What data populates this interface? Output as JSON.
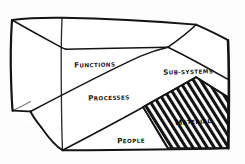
{
  "diagram": {
    "style": "hand-drawn-pen-sketch",
    "background_color": "#fdfdfd",
    "ink_color": "#161616",
    "shape": "3d-box",
    "faces": [
      {
        "id": "functions",
        "label": "FUNCTIONS",
        "label_first_letter": "F",
        "label_rest": "UNCTIONS",
        "hatched": false
      },
      {
        "id": "sub-systems",
        "label": "SUB-SYSTEMS",
        "label_first_letter": "S",
        "label_rest": "UB-SYSTEMS",
        "hatched": false
      },
      {
        "id": "processes",
        "label": "PROCESSES",
        "label_first_letter": "P",
        "label_rest": "ROCESSES",
        "hatched": false
      },
      {
        "id": "material",
        "label": "MATERIAL",
        "label_first_letter": "M",
        "label_rest": "ATERIAL",
        "hatched": true,
        "hatch_direction": "diagonal-up-right"
      },
      {
        "id": "people",
        "label": "PEOPLE",
        "label_first_letter": "P",
        "label_rest": "EOPLE",
        "hatched": false
      }
    ]
  }
}
